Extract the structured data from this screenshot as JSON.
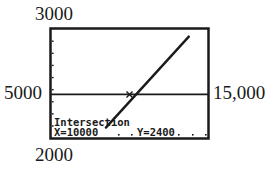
{
  "chart_data": {
    "type": "line",
    "title": "",
    "xlabel": "",
    "ylabel": "",
    "window": {
      "xmin": 5000,
      "xmax": 15000,
      "ymin": 2000,
      "ymax": 3000
    },
    "tick_labels": {
      "ymax": "3000",
      "ymin": "2000",
      "xmin": "5000",
      "xmax": "15,000"
    },
    "series": [
      {
        "name": "horizontal line",
        "points": [
          [
            5000,
            2400
          ],
          [
            15000,
            2400
          ]
        ]
      },
      {
        "name": "increasing line",
        "points": [
          [
            8500,
            2095
          ],
          [
            13780,
            2930
          ]
        ]
      }
    ],
    "intersection": {
      "x": 10000,
      "y": 2400
    },
    "readout": {
      "heading": "Intersection",
      "x_text": "X=10000",
      "y_text": "Y=2400"
    },
    "y_tick_marks_count": 9,
    "grid": false,
    "colors": {
      "ink": "#1a1a1a",
      "background": "#ffffff"
    }
  }
}
